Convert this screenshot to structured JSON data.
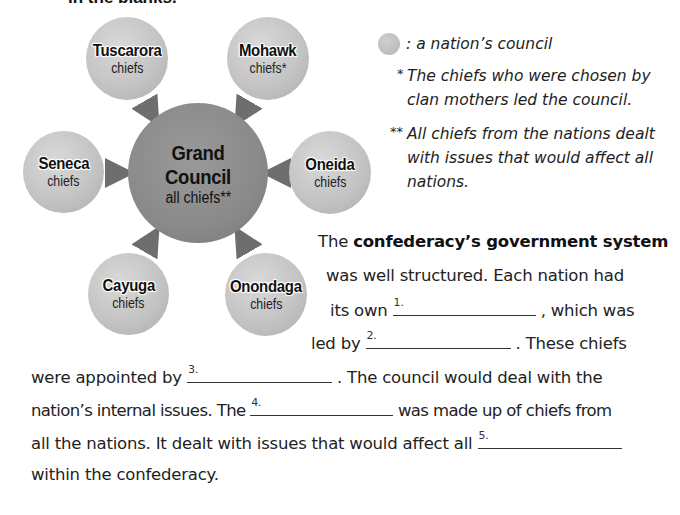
{
  "heading_fragment": "in the blanks.",
  "diagram": {
    "center": {
      "name": "Grand Council",
      "sub": "all chiefs**"
    },
    "nations": [
      {
        "name": "Tuscarora",
        "sub": "chiefs"
      },
      {
        "name": "Mohawk",
        "sub": "chiefs*"
      },
      {
        "name": "Seneca",
        "sub": "chiefs"
      },
      {
        "name": "Oneida",
        "sub": "chiefs"
      },
      {
        "name": "Cayuga",
        "sub": "chiefs"
      },
      {
        "name": "Onondaga",
        "sub": "chiefs"
      }
    ],
    "colors": {
      "nation_circle": "#c4c4c4",
      "center_circle": "#8a8a8a",
      "arrow": "#707070"
    }
  },
  "legend": {
    "symbol_label": ": a nation’s council",
    "note1_mark": "*",
    "note1_lines": [
      "The chiefs who were chosen by",
      "clan mothers led the council."
    ],
    "note2_mark": "**",
    "note2_lines": [
      "All chiefs from the nations dealt",
      "with issues that would affect all",
      "nations."
    ]
  },
  "paragraph": {
    "l1_pre": "The ",
    "l1_bold": "confederacy’s government system",
    "l2": "was well structured.  Each nation had",
    "l3_pre": "its own ",
    "l3_post": " , which was",
    "l4_pre": "led by ",
    "l4_post": " .  These chiefs",
    "l5_pre": "were appointed by ",
    "l5_post": " .  The council would deal with the",
    "l6_pre": "nation’s internal issues.  The ",
    "l6_post": " was made up of chiefs from",
    "l7_pre": "all the nations.  It dealt with issues that would affect all ",
    "l8": "within the confederacy.",
    "blanks": [
      "1.",
      "2.",
      "3.",
      "4.",
      "5."
    ]
  }
}
